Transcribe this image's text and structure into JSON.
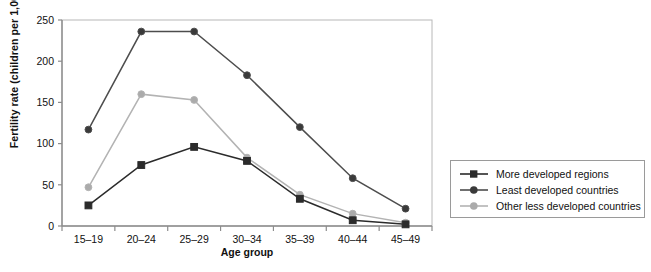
{
  "chart_data": {
    "type": "line",
    "title": "",
    "xlabel": "Age group",
    "ylabel": "Fertility rate (children per 1,000 women)",
    "categories": [
      "15–19",
      "20–24",
      "25–29",
      "30–34",
      "35–39",
      "40–44",
      "45–49"
    ],
    "ylim": [
      0,
      250
    ],
    "yticks": [
      0,
      50,
      100,
      150,
      200,
      250
    ],
    "ytick_labels": [
      "0",
      "50",
      "100",
      "150",
      "200",
      "250"
    ],
    "grid": false,
    "legend_position": "right-outside",
    "series": [
      {
        "name": "More developed regions",
        "color": "#2b2b2b",
        "marker": "square",
        "values": [
          25,
          74,
          96,
          79,
          33,
          7,
          2
        ]
      },
      {
        "name": "Least developed countries",
        "color": "#4d4d4d",
        "marker": "circle",
        "values": [
          117,
          236,
          236,
          183,
          120,
          58,
          21
        ]
      },
      {
        "name": "Other less developed countries",
        "color": "#b3b3b3",
        "marker": "circle",
        "values": [
          47,
          160,
          153,
          83,
          38,
          15,
          4
        ]
      }
    ]
  },
  "axis": {
    "x_title": "Age group",
    "y_title": "Fertility rate (children per 1,000 women)"
  },
  "legend": {
    "items": [
      {
        "label": "More developed regions"
      },
      {
        "label": "Least developed countries"
      },
      {
        "label": "Other less developed countries"
      }
    ]
  }
}
